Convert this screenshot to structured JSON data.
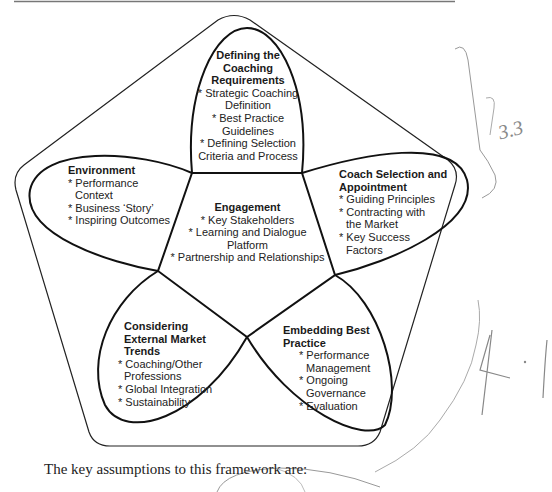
{
  "diagram": {
    "center": {
      "title": "Engagement",
      "items": [
        "* Key Stakeholders",
        "* Learning and Dialogue",
        "Platform",
        "* Partnership and Relationships"
      ]
    },
    "top": {
      "title_lines": [
        "Defining the",
        "Coaching",
        "Requirements"
      ],
      "items": [
        "* Strategic Coaching",
        "Definition",
        "* Best Practice",
        "Guidelines",
        "* Defining Selection",
        "Criteria and Process"
      ]
    },
    "left": {
      "title": "Environment",
      "items": [
        "* Performance",
        "Context",
        "* Business ‘Story’",
        "* Inspiring Outcomes"
      ]
    },
    "right": {
      "title_lines": [
        "Coach Selection and",
        "Appointment"
      ],
      "items": [
        "* Guiding Principles",
        "* Contracting with",
        "the Market",
        "* Key Success",
        "Factors"
      ]
    },
    "bottom_left": {
      "title_lines": [
        "Considering",
        "External Market",
        "Trends"
      ],
      "items": [
        "* Coaching/Other",
        "Professions",
        "* Global Integration",
        "* Sustainability"
      ]
    },
    "bottom_right": {
      "title_lines": [
        "Embedding Best",
        "Practice"
      ],
      "items": [
        "* Performance",
        "Management",
        "* Ongoing",
        "Governance",
        "* Evaluation"
      ]
    }
  },
  "annotations": {
    "handwritten_1": "3.3",
    "handwritten_2": "4. |"
  },
  "caption": "The key assumptions to this framework are:"
}
